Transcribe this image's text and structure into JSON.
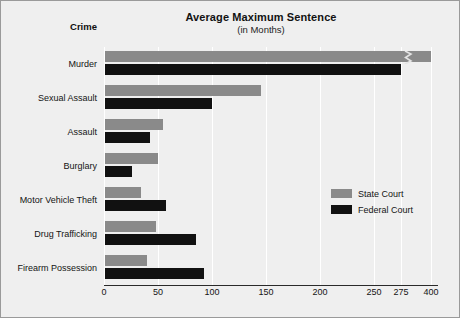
{
  "chart_data": {
    "type": "bar",
    "orientation": "horizontal",
    "title": "Average Maximum Sentence",
    "subtitle": "(in Months)",
    "category_axis_title": "Crime",
    "xlabel": "",
    "ylabel": "Crime",
    "categories": [
      "Murder",
      "Sexual Assault",
      "Assault",
      "Burglary",
      "Motor Vehicle Theft",
      "Drug Trafficking",
      "Firearm Possession"
    ],
    "series": [
      {
        "name": "State Court",
        "color": "#8a8a8a",
        "values": [
          400,
          145,
          55,
          50,
          34,
          48,
          40
        ]
      },
      {
        "name": "Federal Court",
        "color": "#111111",
        "values": [
          275,
          100,
          43,
          26,
          57,
          85,
          93
        ]
      }
    ],
    "xticks": [
      0,
      50,
      100,
      150,
      200,
      250,
      275,
      400
    ],
    "xtick_labels": [
      "0",
      "50",
      "100",
      "150",
      "200",
      "250",
      "275",
      "400"
    ],
    "xlim": [
      0,
      400
    ],
    "axis_break": true,
    "axis_break_after": 275,
    "grid": true,
    "legend_position": "middle-right",
    "legend_entries": [
      "State Court",
      "Federal Court"
    ]
  },
  "icons": {
    "axis_break": "axis-break-zigzag-icon"
  }
}
